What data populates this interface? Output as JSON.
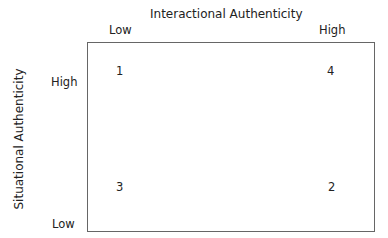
{
  "x_axis": {
    "title": "Interactional Authenticity",
    "low": "Low",
    "high": "High"
  },
  "y_axis": {
    "title": "Situational Authenticity",
    "low": "Low",
    "high": "High"
  },
  "quadrants": {
    "low_x_high_y": "1",
    "high_x_high_y": "4",
    "low_x_low_y": "3",
    "high_x_low_y": "2"
  }
}
